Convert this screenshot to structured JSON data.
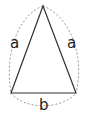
{
  "diagram": {
    "labels": {
      "left_side": "a",
      "right_side": "a",
      "base": "b"
    },
    "colors": {
      "triangle_stroke": "#333333",
      "dashed_arc": "#999999",
      "label": "#222222"
    },
    "vertices": {
      "apex": [
        43,
        6
      ],
      "base_left": [
        11,
        93
      ],
      "base_right": [
        76,
        93
      ]
    }
  }
}
